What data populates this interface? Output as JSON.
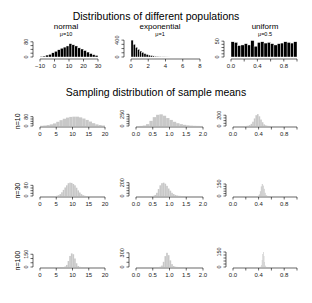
{
  "titles": {
    "top": "Distributions of different populations",
    "middle": "Sampling distribution of sample means"
  },
  "chart_data": [
    {
      "type": "bar",
      "name": "normal",
      "subtitle": "μ=10",
      "fill": "#000000",
      "xlim": [
        -12,
        32
      ],
      "xticks": [
        -10,
        0,
        10,
        20,
        30
      ],
      "xtick_labels": [
        "−10",
        "0",
        "10",
        "20",
        "30"
      ],
      "ylim": [
        0,
        100
      ],
      "yticks": [
        0,
        20,
        40,
        60,
        80
      ],
      "ytick_labels": [
        "0",
        "80"
      ],
      "ylabel": "",
      "bins_start": -10,
      "bin_width": 2,
      "values": [
        3,
        5,
        10,
        14,
        22,
        30,
        38,
        46,
        52,
        58,
        70,
        64,
        58,
        48,
        42,
        34,
        26,
        18,
        12,
        8
      ]
    },
    {
      "type": "bar",
      "name": "exponential",
      "subtitle": "μ=1",
      "fill": "#000000",
      "xlim": [
        -0.2,
        8.2
      ],
      "xticks": [
        0,
        2,
        4,
        6,
        8
      ],
      "xtick_labels": [
        "0",
        "2",
        "4",
        "6",
        "8"
      ],
      "ylim": [
        0,
        450
      ],
      "yticks": [
        0,
        100,
        200,
        300,
        400
      ],
      "ytick_labels": [
        "0",
        "400"
      ],
      "ylabel": "",
      "bins_start": 0,
      "bin_width": 0.25,
      "values": [
        400,
        300,
        230,
        180,
        140,
        110,
        80,
        60,
        45,
        35,
        25,
        18,
        12,
        8,
        5,
        3,
        2,
        1
      ]
    },
    {
      "type": "bar",
      "name": "uniform",
      "subtitle": "μ=0.5",
      "fill": "#000000",
      "xlim": [
        -0.02,
        1.02
      ],
      "xticks": [
        0,
        0.2,
        0.4,
        0.6,
        0.8,
        1.0
      ],
      "xtick_labels": [
        "0.0",
        "",
        "0.4",
        "",
        "0.8",
        ""
      ],
      "ylim": [
        0,
        60
      ],
      "yticks": [
        0,
        10,
        20,
        30,
        40,
        50
      ],
      "ytick_labels": [
        "0",
        "50"
      ],
      "ylabel": "",
      "bins_start": 0,
      "bin_width": 0.05,
      "values": [
        48,
        46,
        36,
        38,
        42,
        38,
        52,
        34,
        46,
        48,
        44,
        46,
        42,
        38,
        42,
        44,
        48,
        46,
        44,
        48
      ]
    },
    {
      "type": "bar",
      "name": "normal n=10",
      "fill": "#c8c8c8",
      "ylabel": "n=10",
      "xlim": [
        -0.5,
        20.5
      ],
      "xticks": [
        0,
        5,
        10,
        15,
        20
      ],
      "xtick_labels": [
        "0",
        "5",
        "10",
        "15",
        "20"
      ],
      "ylim": [
        0,
        120
      ],
      "yticks": [
        0,
        20,
        40,
        60,
        80
      ],
      "ytick_labels": [
        "0",
        "80"
      ],
      "bins_start": 0,
      "bin_width": 1,
      "values": [
        2,
        4,
        8,
        14,
        22,
        36,
        50,
        62,
        72,
        78,
        80,
        80,
        74,
        64,
        52,
        38,
        24,
        14,
        8,
        4
      ]
    },
    {
      "type": "bar",
      "name": "exponential n=10",
      "fill": "#c8c8c8",
      "ylabel": "",
      "xlim": [
        -0.05,
        2.05
      ],
      "xticks": [
        0,
        0.5,
        1.0,
        1.5,
        2.0
      ],
      "xtick_labels": [
        "0.0",
        "0.5",
        "1.0",
        "1.5",
        "2.0"
      ],
      "ylim": [
        0,
        300
      ],
      "yticks": [
        0,
        50,
        100,
        150,
        200,
        250
      ],
      "ytick_labels": [
        "0",
        "250"
      ],
      "bins_start": 0,
      "bin_width": 0.1,
      "values": [
        0,
        2,
        10,
        40,
        110,
        190,
        240,
        250,
        220,
        170,
        130,
        90,
        60,
        40,
        25,
        14,
        8,
        4,
        2,
        1
      ]
    },
    {
      "type": "bar",
      "name": "uniform n=10",
      "fill": "#c8c8c8",
      "ylabel": "",
      "xlim": [
        -0.02,
        1.02
      ],
      "xticks": [
        0,
        0.2,
        0.4,
        0.6,
        0.8,
        1.0
      ],
      "xtick_labels": [
        "0.0",
        "",
        "0.4",
        "",
        "0.8",
        ""
      ],
      "ylim": [
        0,
        260
      ],
      "yticks": [
        0,
        50,
        100,
        150,
        200
      ],
      "ytick_labels": [
        "0",
        "200"
      ],
      "bins_start": 0.2,
      "bin_width": 0.025,
      "values": [
        2,
        6,
        16,
        40,
        80,
        140,
        200,
        220,
        180,
        120,
        70,
        30,
        12,
        4,
        2,
        1
      ]
    },
    {
      "type": "bar",
      "name": "normal n=30",
      "fill": "#c8c8c8",
      "ylabel": "n=30",
      "xlim": [
        -0.5,
        20.5
      ],
      "xticks": [
        0,
        5,
        10,
        15,
        20
      ],
      "xtick_labels": [
        "0",
        "5",
        "10",
        "15",
        "20"
      ],
      "ylim": [
        0,
        120
      ],
      "yticks": [
        0,
        20,
        40,
        60,
        80
      ],
      "ytick_labels": [
        "0",
        "80"
      ],
      "bins_start": 5,
      "bin_width": 0.5,
      "values": [
        2,
        6,
        14,
        28,
        46,
        64,
        80,
        96,
        100,
        98,
        90,
        80,
        62,
        42,
        26,
        14,
        6,
        2
      ]
    },
    {
      "type": "bar",
      "name": "exponential n=30",
      "fill": "#c8c8c8",
      "ylabel": "",
      "xlim": [
        -0.05,
        2.05
      ],
      "xticks": [
        0,
        0.5,
        1.0,
        1.5,
        2.0
      ],
      "xtick_labels": [
        "0.0",
        "0.5",
        "1.0",
        "1.5",
        "2.0"
      ],
      "ylim": [
        0,
        300
      ],
      "yticks": [
        0,
        50,
        100,
        150,
        200,
        250
      ],
      "ytick_labels": [
        "0",
        "200"
      ],
      "bins_start": 0.5,
      "bin_width": 0.05,
      "values": [
        4,
        20,
        60,
        130,
        200,
        240,
        250,
        230,
        190,
        140,
        100,
        60,
        36,
        20,
        10,
        4,
        2
      ]
    },
    {
      "type": "bar",
      "name": "uniform n=30",
      "fill": "#c8c8c8",
      "ylabel": "",
      "xlim": [
        -0.02,
        1.02
      ],
      "xticks": [
        0,
        0.2,
        0.4,
        0.6,
        0.8,
        1.0
      ],
      "xtick_labels": [
        "0.0",
        "",
        "0.4",
        "",
        "0.8",
        ""
      ],
      "ylim": [
        0,
        200
      ],
      "yticks": [
        0,
        30,
        60,
        90,
        120,
        150
      ],
      "ytick_labels": [
        "0",
        "150"
      ],
      "bins_start": 0.39,
      "bin_width": 0.015,
      "values": [
        4,
        20,
        60,
        120,
        150,
        130,
        90,
        40,
        12,
        2
      ]
    },
    {
      "type": "bar",
      "name": "normal n=100",
      "fill": "#c8c8c8",
      "ylabel": "n=100",
      "xlim": [
        -0.5,
        20.5
      ],
      "xticks": [
        0,
        5,
        10,
        15,
        20
      ],
      "xtick_labels": [
        "0",
        "5",
        "10",
        "15",
        "20"
      ],
      "ylim": [
        0,
        200
      ],
      "yticks": [
        0,
        50,
        100,
        150
      ],
      "ytick_labels": [
        "0",
        "150"
      ],
      "bins_start": 7.5,
      "bin_width": 0.5,
      "values": [
        6,
        24,
        70,
        130,
        160,
        150,
        100,
        44,
        12,
        2
      ]
    },
    {
      "type": "bar",
      "name": "exponential n=100",
      "fill": "#c8c8c8",
      "ylabel": "",
      "xlim": [
        -0.05,
        2.05
      ],
      "xticks": [
        0,
        0.5,
        1.0,
        1.5,
        2.0
      ],
      "xtick_labels": [
        "0.0",
        "0.5",
        "1.0",
        "1.5",
        "2.0"
      ],
      "ylim": [
        0,
        360
      ],
      "yticks": [
        0,
        100,
        200,
        300
      ],
      "ytick_labels": [
        "0",
        "300"
      ],
      "bins_start": 0.7,
      "bin_width": 0.05,
      "values": [
        6,
        30,
        110,
        230,
        300,
        250,
        140,
        60,
        20,
        6,
        2
      ]
    },
    {
      "type": "bar",
      "name": "uniform n=100",
      "fill": "#c8c8c8",
      "ylabel": "",
      "xlim": [
        -0.02,
        1.02
      ],
      "xticks": [
        0,
        0.2,
        0.4,
        0.6,
        0.8,
        1.0
      ],
      "xtick_labels": [
        "0.0",
        "",
        "0.4",
        "",
        "0.8",
        ""
      ],
      "ylim": [
        0,
        170
      ],
      "yticks": [
        0,
        30,
        60,
        90,
        120,
        150
      ],
      "ytick_labels": [
        "0",
        "150"
      ],
      "bins_start": 0.43,
      "bin_width": 0.01,
      "values": [
        4,
        20,
        70,
        130,
        150,
        110,
        50,
        14,
        2
      ]
    }
  ]
}
